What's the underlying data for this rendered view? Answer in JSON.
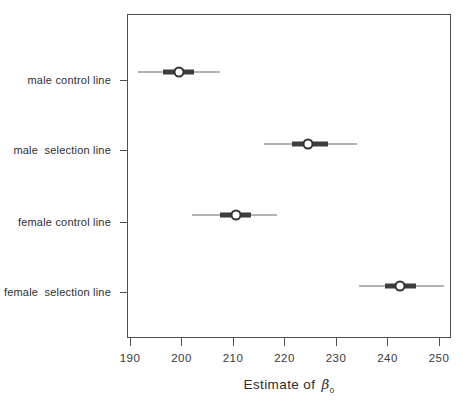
{
  "chart_data": {
    "type": "scatter",
    "subtype": "interval-dot-plot",
    "title": "",
    "xlabel": "Estimate of β0",
    "xlabel_parts": {
      "prefix": "Estimate of",
      "symbol": "β",
      "subscript": "0"
    },
    "ylabel": "",
    "xlim": [
      190,
      250
    ],
    "x_ticks": [
      "190",
      "200",
      "210",
      "220",
      "230",
      "240",
      "250"
    ],
    "grid": "off",
    "legend": "none",
    "categories": [
      "male control line",
      "male  selection line",
      "female control line",
      "female  selection line"
    ],
    "rows": [
      {
        "label": "male control line",
        "estimate": 199.5,
        "inner_interval": [
          196.5,
          202.5
        ],
        "outer_interval": [
          191.5,
          207.5
        ]
      },
      {
        "label": "male  selection line",
        "estimate": 224.5,
        "inner_interval": [
          221.5,
          228.5
        ],
        "outer_interval": [
          216.0,
          234.0
        ]
      },
      {
        "label": "female control line",
        "estimate": 210.5,
        "inner_interval": [
          207.5,
          213.5
        ],
        "outer_interval": [
          202.0,
          218.5
        ]
      },
      {
        "label": "female  selection line",
        "estimate": 242.5,
        "inner_interval": [
          239.5,
          245.5
        ],
        "outer_interval": [
          234.5,
          251.0
        ]
      }
    ],
    "colors": {
      "outer_line": "#b3b3b3",
      "inner_bar": "#3d3d3d",
      "point_fill": "#ffffff",
      "point_stroke": "#333333",
      "axis": "#4f4f4f",
      "text": "#2e2e2e"
    }
  }
}
